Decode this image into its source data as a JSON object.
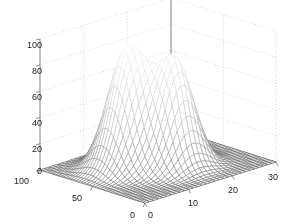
{
  "figure": {
    "background_color": "#ffffff",
    "axis_line_color": "#808080",
    "grid_color": "#b8b8b8",
    "tick_text_color": "#1a1a1a",
    "mesh_line_color": "#909090"
  },
  "chart_data": {
    "type": "surface",
    "title": "",
    "xlabel": "",
    "ylabel": "",
    "zlabel": "",
    "grid": true,
    "legend": null,
    "shading": "grayscale-mesh",
    "projection": "3d-mesh",
    "view": {
      "azimuth": -37.5,
      "elevation": 30
    },
    "x_axis": {
      "name": "x",
      "ticks": [
        0,
        10,
        20,
        30
      ],
      "tick_labels": [
        "0",
        "10",
        "20",
        "30"
      ],
      "range": [
        0,
        30
      ]
    },
    "y_axis": {
      "name": "y",
      "ticks": [
        0,
        50,
        100
      ],
      "tick_labels": [
        "0",
        "50",
        "100"
      ],
      "range": [
        0,
        100
      ]
    },
    "z_axis": {
      "name": "z",
      "ticks": [
        0,
        20,
        40,
        60,
        80,
        100
      ],
      "tick_labels": [
        "0",
        "20",
        "40",
        "60",
        "80",
        "100"
      ],
      "range": [
        0,
        100
      ]
    },
    "surface": {
      "description": "Sum of two 2-D Gaussian peaks on a 30 x 100 grid",
      "grid_nx": 31,
      "grid_ny": 41,
      "peaks": [
        {
          "label": "peak-1",
          "x": 11.0,
          "y": 62.0,
          "height": 92,
          "sigma_x": 3.6,
          "sigma_y": 12.0
        },
        {
          "label": "peak-2",
          "x": 16.5,
          "y": 40.0,
          "height": 80,
          "sigma_x": 3.4,
          "sigma_y": 11.0
        }
      ],
      "baseline": 0,
      "z_max_observed": 92
    }
  },
  "tick_labels": {
    "z": [
      "100",
      "80",
      "60",
      "40",
      "20",
      "0"
    ],
    "y": [
      "100",
      "50",
      "0"
    ],
    "x": [
      "0",
      "10",
      "20",
      "30"
    ]
  }
}
